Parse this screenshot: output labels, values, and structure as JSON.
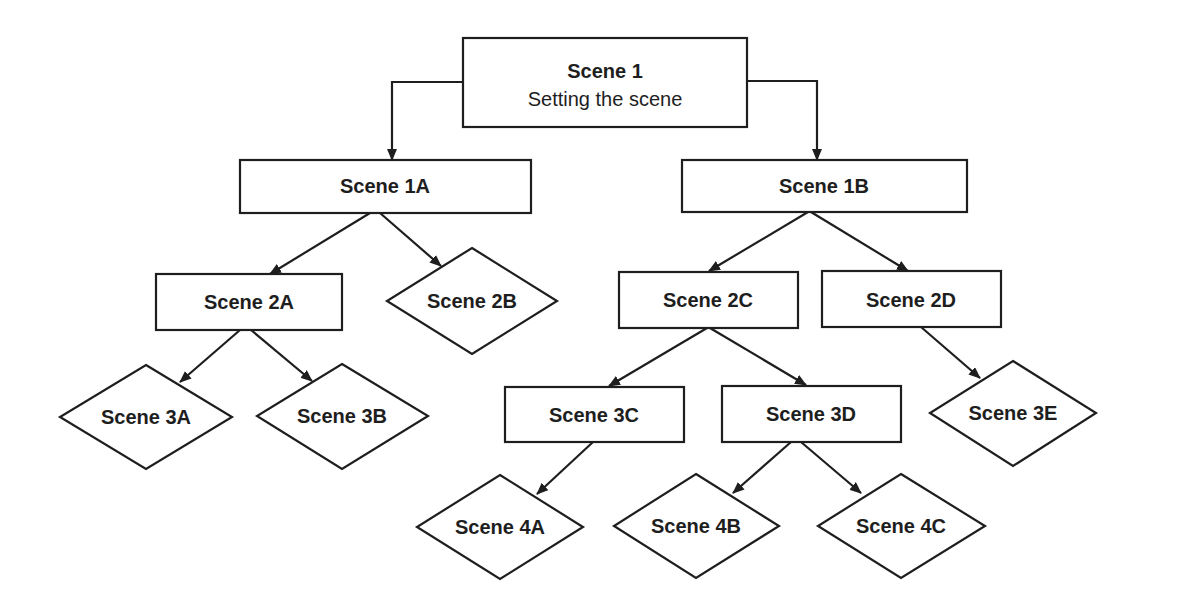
{
  "diagram": {
    "type": "flowchart-tree",
    "colors": {
      "stroke": "#1e1e1e",
      "fill": "#ffffff",
      "text": "#1e1e1e"
    },
    "nodes": {
      "scene1": {
        "label": "Scene 1",
        "sublabel": "Setting the scene",
        "shape": "rectangle"
      },
      "scene1A": {
        "label": "Scene 1A",
        "shape": "rectangle"
      },
      "scene1B": {
        "label": "Scene 1B",
        "shape": "rectangle"
      },
      "scene2A": {
        "label": "Scene 2A",
        "shape": "rectangle"
      },
      "scene2B": {
        "label": "Scene 2B",
        "shape": "diamond"
      },
      "scene2C": {
        "label": "Scene 2C",
        "shape": "rectangle"
      },
      "scene2D": {
        "label": "Scene 2D",
        "shape": "rectangle"
      },
      "scene3A": {
        "label": "Scene 3A",
        "shape": "diamond"
      },
      "scene3B": {
        "label": "Scene 3B",
        "shape": "diamond"
      },
      "scene3C": {
        "label": "Scene 3C",
        "shape": "rectangle"
      },
      "scene3D": {
        "label": "Scene 3D",
        "shape": "rectangle"
      },
      "scene3E": {
        "label": "Scene 3E",
        "shape": "diamond"
      },
      "scene4A": {
        "label": "Scene 4A",
        "shape": "diamond"
      },
      "scene4B": {
        "label": "Scene 4B",
        "shape": "diamond"
      },
      "scene4C": {
        "label": "Scene 4C",
        "shape": "diamond"
      }
    },
    "edges": [
      {
        "from": "Scene 1",
        "to": "Scene 1A"
      },
      {
        "from": "Scene 1",
        "to": "Scene 1B"
      },
      {
        "from": "Scene 1A",
        "to": "Scene 2A"
      },
      {
        "from": "Scene 1A",
        "to": "Scene 2B"
      },
      {
        "from": "Scene 1B",
        "to": "Scene 2C"
      },
      {
        "from": "Scene 1B",
        "to": "Scene 2D"
      },
      {
        "from": "Scene 2A",
        "to": "Scene 3A"
      },
      {
        "from": "Scene 2A",
        "to": "Scene 3B"
      },
      {
        "from": "Scene 2C",
        "to": "Scene 3C"
      },
      {
        "from": "Scene 2C",
        "to": "Scene 3D"
      },
      {
        "from": "Scene 2D",
        "to": "Scene 3E"
      },
      {
        "from": "Scene 3C",
        "to": "Scene 4A"
      },
      {
        "from": "Scene 3D",
        "to": "Scene 4B"
      },
      {
        "from": "Scene 3D",
        "to": "Scene 4C"
      }
    ]
  }
}
